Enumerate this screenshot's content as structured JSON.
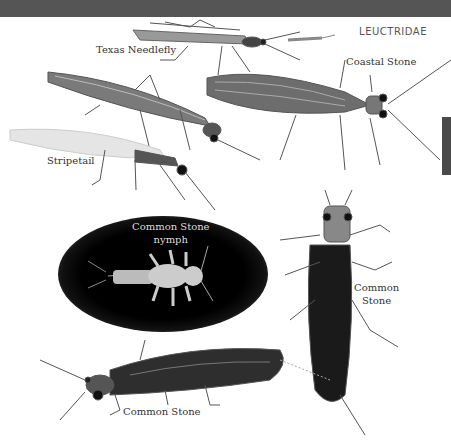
{
  "header": {
    "family_label": "LEUCTRIDAE"
  },
  "species_labels": [
    {
      "id": "texas-needlefly",
      "text": "Texas Needlefly"
    },
    {
      "id": "coastal-stone",
      "text": "Coastal Stone"
    },
    {
      "id": "stripetail",
      "text": "Stripetail"
    },
    {
      "id": "common-stone-nymph",
      "line1": "Common Stone",
      "line2": "nymph"
    },
    {
      "id": "common-stone-right",
      "line1": "Common",
      "line2": "Stone"
    },
    {
      "id": "common-stone-bottom",
      "text": "Common Stone"
    }
  ],
  "colors": {
    "top_bar": "#555555",
    "side_tab": "#4a4a4a",
    "text": "#333333"
  }
}
